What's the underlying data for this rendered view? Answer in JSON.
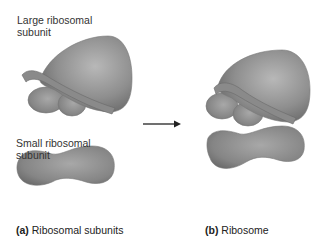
{
  "labels": {
    "large_subunit_line1": "Large ribosomal",
    "large_subunit_line2": "subunit",
    "small_subunit_line1": "Small ribosomal",
    "small_subunit_line2": "subunit"
  },
  "captions": {
    "a_letter": "(a)",
    "a_text": " Ribosomal subunits",
    "b_letter": "(b)",
    "b_text": " Ribosome"
  },
  "colors": {
    "subunit_fill": "#8c8c8c",
    "subunit_highlight": "#b5b5b5",
    "subunit_shadow": "#5e5e5e",
    "arrow": "#222222"
  }
}
